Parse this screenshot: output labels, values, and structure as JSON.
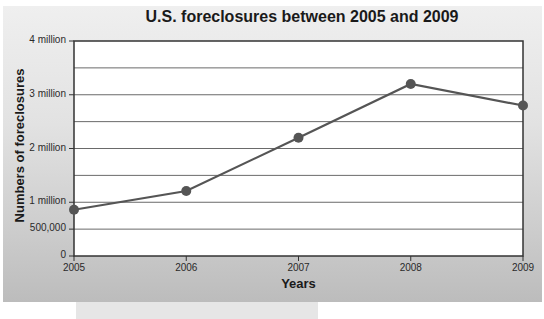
{
  "chart_data": {
    "type": "line",
    "title": "U.S. foreclosures between 2005 and 2009",
    "xlabel": "Years",
    "ylabel": "Numbers of foreclosures",
    "categories": [
      "2005",
      "2006",
      "2007",
      "2008",
      "2009"
    ],
    "series": [
      {
        "name": "Foreclosures",
        "values": [
          860000,
          1210000,
          2200000,
          3200000,
          2800000
        ]
      }
    ],
    "y_ticks": [
      {
        "value": 0,
        "label": "0"
      },
      {
        "value": 500000,
        "label": "500,000"
      },
      {
        "value": 1000000,
        "label": "1 million"
      },
      {
        "value": 2000000,
        "label": "2 million"
      },
      {
        "value": 3000000,
        "label": "3 million"
      },
      {
        "value": 4000000,
        "label": "4 million"
      }
    ],
    "ylim": [
      0,
      4000000
    ],
    "grid": true,
    "gridline_step": 500000,
    "legend": "none",
    "colors": {
      "line": "#555555",
      "marker": "#555555",
      "plot_bg": "#ffffff",
      "panel_bg": "#d9d9d9"
    }
  }
}
